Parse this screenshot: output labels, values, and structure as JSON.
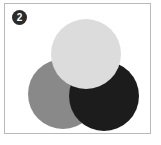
{
  "figure": {
    "panel_label": "2",
    "label_glyph": "❷",
    "label_bg_color": "#2b2b2b",
    "label_text_color": "#ffffff",
    "frame_border_color": "#b9b9b9",
    "background_color": "#ffffff"
  },
  "chart_data": {
    "type": "venn",
    "title": "",
    "subtitle": "",
    "xlabel": "",
    "ylabel": "",
    "grid": false,
    "legend_position": "none",
    "sets": [
      {
        "name": "light-gray-circle",
        "label": "",
        "color": "#dcdcdc",
        "center_x": 81,
        "center_y": 50,
        "radius": 35,
        "z_order": 3
      },
      {
        "name": "medium-gray-circle",
        "label": "",
        "color": "#898989",
        "center_x": 58,
        "center_y": 90,
        "radius": 35,
        "z_order": 1
      },
      {
        "name": "dark-circle",
        "label": "",
        "color": "#1c1c1c",
        "center_x": 99,
        "center_y": 92,
        "radius": 35,
        "z_order": 2
      }
    ],
    "annotations": [
      {
        "name": "panel-number",
        "text": "2"
      }
    ]
  }
}
